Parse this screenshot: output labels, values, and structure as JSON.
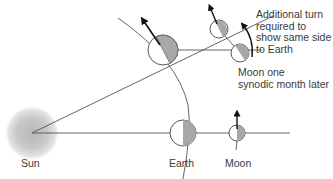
{
  "diagram": {
    "labels": {
      "sun": "Sun",
      "earth": "Earth",
      "moon": "Moon",
      "moon_later_line1": "Moon one",
      "moon_later_line2": "synodic month later",
      "additional_turn_line1": "Additional turn",
      "additional_turn_line2": "required to",
      "additional_turn_line3": "show same side",
      "additional_turn_line4": "to Earth"
    },
    "colors": {
      "shadow": "#a8a8a8",
      "line": "#4a4a4a",
      "sun_glow": "#bdbdbd",
      "body_fill": "#ffffff"
    }
  }
}
